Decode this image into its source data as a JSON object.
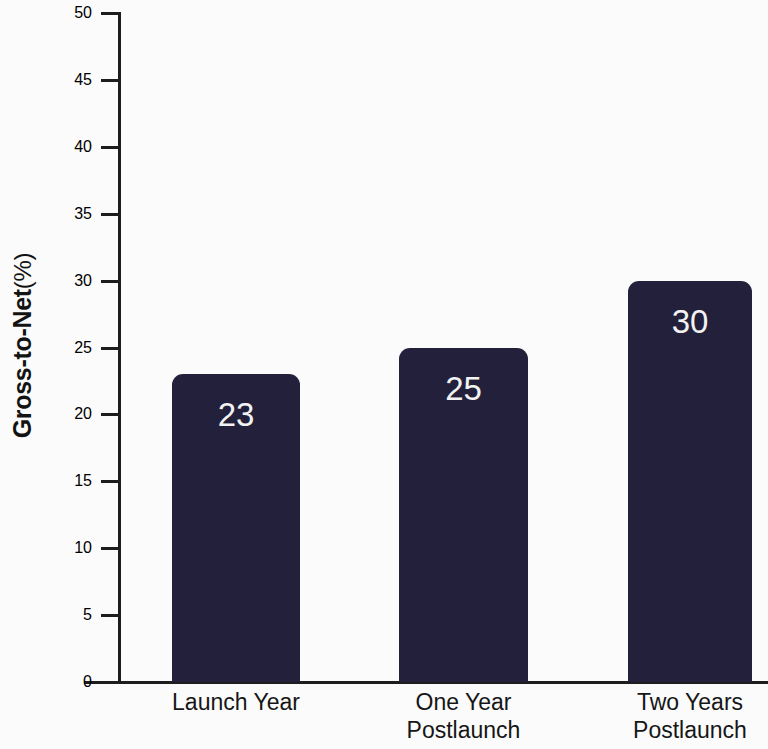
{
  "chart_data": {
    "type": "bar",
    "title": "",
    "subtitle": "",
    "xlabel": "",
    "ylabel": "Gross-to-Net (%)",
    "ylabel_main": "Gross-to-Net",
    "ylabel_unit": "(%)",
    "categories": [
      "Launch Year",
      "One Year Postlaunch",
      "Two Years Postlaunch"
    ],
    "category_lines": [
      [
        "Launch Year"
      ],
      [
        "One Year",
        "Postlaunch"
      ],
      [
        "Two Years",
        "Postlaunch"
      ]
    ],
    "values": [
      23,
      25,
      30
    ],
    "value_labels": [
      "23",
      "25",
      "30"
    ],
    "ylim": [
      0,
      50
    ],
    "ytick_values": [
      0,
      5,
      10,
      15,
      20,
      25,
      30,
      35,
      40,
      45,
      50
    ],
    "ytick_labels": [
      "0",
      "5",
      "10",
      "15",
      "20",
      "25",
      "30",
      "35",
      "40",
      "45",
      "50"
    ],
    "grid": false,
    "legend": false,
    "legend_position": "none",
    "colors": {
      "bar_fill": "#22203a",
      "value_label": "#f2f2f2",
      "axis": "#1d1d1d",
      "text": "#151515",
      "background": "#fbfbfb"
    }
  }
}
